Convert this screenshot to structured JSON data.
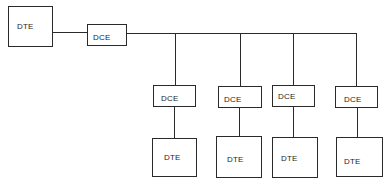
{
  "diagram": {
    "type": "network-topology",
    "line_color": "#2a2a2a",
    "background": "#ffffff",
    "nodes": {
      "source_dte": {
        "label": "DTE"
      },
      "source_dce": {
        "label": "DCE"
      },
      "branches": [
        {
          "dce_label": "DCE",
          "dte_label": "DTE"
        },
        {
          "dce_label": "DCE",
          "dte_label": "DTE"
        },
        {
          "dce_label": "DCE",
          "dte_label": "DTE"
        },
        {
          "dce_label": "DCE",
          "dte_label": "DTE"
        }
      ]
    },
    "edges": [
      {
        "from": "source_dte",
        "to": "source_dce"
      },
      {
        "from": "source_dce",
        "to": "bus"
      },
      {
        "from": "bus",
        "to": "branch_0_dce"
      },
      {
        "from": "bus",
        "to": "branch_1_dce"
      },
      {
        "from": "bus",
        "to": "branch_2_dce"
      },
      {
        "from": "bus",
        "to": "branch_3_dce"
      },
      {
        "from": "branch_0_dce",
        "to": "branch_0_dte"
      },
      {
        "from": "branch_1_dce",
        "to": "branch_1_dte"
      },
      {
        "from": "branch_2_dce",
        "to": "branch_2_dte"
      },
      {
        "from": "branch_3_dce",
        "to": "branch_3_dte"
      }
    ]
  }
}
